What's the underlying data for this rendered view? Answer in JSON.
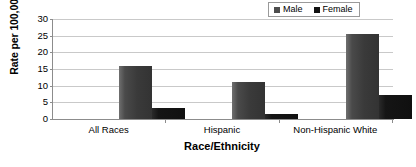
{
  "chart_data": {
    "type": "bar",
    "title": "",
    "xlabel": "Race/Ethnicity",
    "ylabel": "Rate per 100,000",
    "categories": [
      "All Races",
      "Hispanic",
      "Non-Hispanic White"
    ],
    "series": [
      {
        "name": "Male",
        "values": [
          15.9,
          11.0,
          25.5
        ],
        "color": "#3a3a3a"
      },
      {
        "name": "Female",
        "values": [
          3.3,
          1.5,
          7.3
        ],
        "color": "#111111"
      }
    ],
    "ylim": [
      0,
      30
    ],
    "yticks": [
      0,
      5,
      10,
      15,
      20,
      25,
      30
    ],
    "ytick_labels": [
      "0",
      "5",
      "10",
      "15",
      "20",
      "25",
      "30"
    ],
    "grid": true,
    "legend_position": "top-right",
    "legend_entries": [
      "Male",
      "Female"
    ]
  },
  "legend": {
    "male_label": "Male",
    "female_label": "Female"
  },
  "axes": {
    "y_title": "Rate per 100,000",
    "x_title": "Race/Ethnicity"
  }
}
